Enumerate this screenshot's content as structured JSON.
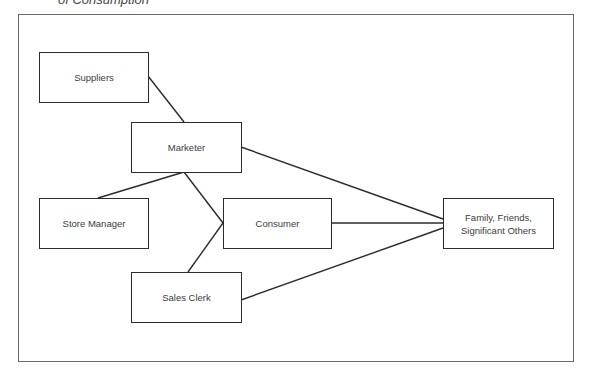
{
  "caption": "of Consumption",
  "diagram": {
    "nodes": [
      {
        "id": "suppliers",
        "label": "Suppliers"
      },
      {
        "id": "marketer",
        "label": "Marketer"
      },
      {
        "id": "store_manager",
        "label": "Store Manager"
      },
      {
        "id": "consumer",
        "label": "Consumer"
      },
      {
        "id": "sales_clerk",
        "label": "Sales Clerk"
      },
      {
        "id": "family",
        "label": "Family, Friends,\nSignificant Others"
      }
    ],
    "edges": [
      {
        "from": "suppliers",
        "to": "marketer"
      },
      {
        "from": "marketer",
        "to": "store_manager"
      },
      {
        "from": "marketer",
        "to": "consumer"
      },
      {
        "from": "marketer",
        "to": "family"
      },
      {
        "from": "sales_clerk",
        "to": "consumer"
      },
      {
        "from": "consumer",
        "to": "family"
      },
      {
        "from": "sales_clerk",
        "to": "family"
      }
    ]
  }
}
